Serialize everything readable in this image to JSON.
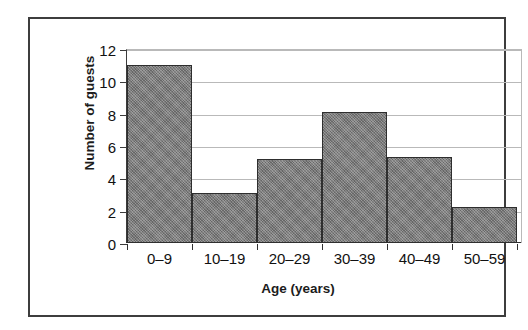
{
  "chart_data": {
    "type": "bar",
    "title": "",
    "subtitle": "",
    "xlabel": "Age (years)",
    "ylabel": "Number of guests",
    "categories": [
      "0–9",
      "10–19",
      "20–29",
      "30–39",
      "40–49",
      "50–59"
    ],
    "values": [
      11,
      3.1,
      5.2,
      8.1,
      5.3,
      2.2
    ],
    "series": [
      {
        "name": "Number of guests",
        "values": [
          11,
          3.1,
          5.2,
          8.1,
          5.3,
          2.2
        ]
      }
    ],
    "ylim": [
      0,
      12
    ],
    "ytick_labels": [
      "0",
      "2",
      "4",
      "6",
      "8",
      "10",
      "12"
    ],
    "ytick_values": [
      0,
      2,
      4,
      6,
      8,
      10,
      12
    ],
    "grid": "horizontal",
    "legend": "none",
    "bar_style": "contiguous-histogram",
    "colors": {
      "bar_fill": "#7b7b7b",
      "bar_edge": "#2e2e2e",
      "gridline": "#b9b9b9",
      "axis": "#2f2f2f",
      "text": "#111111",
      "frame": "#3d3d3d",
      "background": "#ffffff"
    },
    "annotations": []
  },
  "figure": {
    "frame_border": "true"
  }
}
